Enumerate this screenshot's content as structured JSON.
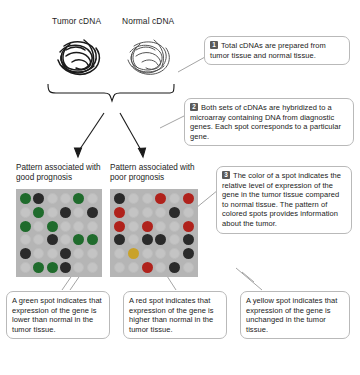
{
  "sources": {
    "tumor_label": "Tumor cDNA",
    "normal_label": "Normal cDNA"
  },
  "steps": [
    {
      "number": "1",
      "text": "Total cDNAs are prepared from tumor tissue and normal tissue."
    },
    {
      "number": "2",
      "text": "Both sets of cDNAs are hybridized to a microarray containing DNA from diagnostic genes. Each spot corresponds to a particular gene."
    },
    {
      "number": "3",
      "text": "The color of a spot indicates the relative level of expression of the gene in the tumor tissue compared to normal tissue. The pattern of colored spots provides information about the tumor."
    }
  ],
  "arrays": [
    {
      "caption": "Pattern associated with good prognosis",
      "rows": 6,
      "columns": 6,
      "spots": [
        [
          "green",
          "dark",
          "empty",
          "empty",
          "green",
          "empty"
        ],
        [
          "empty",
          "green",
          "empty",
          "dark",
          "empty",
          "dark"
        ],
        [
          "green",
          "empty",
          "green",
          "empty",
          "empty",
          "empty"
        ],
        [
          "empty",
          "empty",
          "dark",
          "empty",
          "green",
          "green"
        ],
        [
          "dark",
          "empty",
          "empty",
          "dark",
          "empty",
          "empty"
        ],
        [
          "empty",
          "green",
          "green",
          "dark",
          "empty",
          "empty"
        ]
      ]
    },
    {
      "caption": "Pattern associated with poor prognosis",
      "rows": 6,
      "columns": 6,
      "spots": [
        [
          "dark",
          "empty",
          "empty",
          "red",
          "empty",
          "red"
        ],
        [
          "red",
          "empty",
          "empty",
          "empty",
          "dark",
          "empty"
        ],
        [
          "red",
          "empty",
          "red",
          "empty",
          "empty",
          "red"
        ],
        [
          "dark",
          "empty",
          "dark",
          "dark",
          "empty",
          "dark"
        ],
        [
          "empty",
          "yellow",
          "empty",
          "empty",
          "empty",
          "dark"
        ],
        [
          "empty",
          "empty",
          "red",
          "empty",
          "dark",
          "empty"
        ]
      ]
    }
  ],
  "legend": [
    {
      "color": "green",
      "text": "A green spot indicates that expression of the gene is lower than normal in the tumor tissue."
    },
    {
      "color": "red",
      "text": "A red spot indicates that expression of the gene is higher than normal in the tumor tissue."
    },
    {
      "color": "yellow",
      "text": "A yellow spot indicates that expression of the gene is unchanged in the tumor tissue."
    }
  ],
  "colors": {
    "green": "#1f6b2c",
    "red": "#b0221c",
    "yellow": "#c9a22a",
    "array_background": "#b5b5b5",
    "callout_border": "#b9b9b9",
    "step_badge": "#5a5a5a"
  }
}
